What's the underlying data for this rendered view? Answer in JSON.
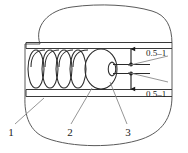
{
  "figure": {
    "type": "technical-cross-section-diagram",
    "background_color": "#ffffff",
    "line_color": "#3a3a3a",
    "leader_color": "#7a7a7a",
    "text_color": "#1a1a1a"
  },
  "dimensions": [
    {
      "id": "dim-top",
      "label": "0.5–1"
    },
    {
      "id": "dim-bottom",
      "label": "0.5–1"
    }
  ],
  "callouts": [
    {
      "id": "callout-1",
      "label": "1"
    },
    {
      "id": "callout-2",
      "label": "2"
    },
    {
      "id": "callout-3",
      "label": "3"
    }
  ]
}
